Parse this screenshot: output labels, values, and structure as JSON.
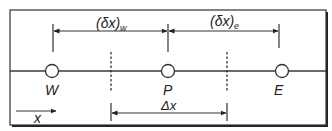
{
  "diagram": {
    "colors": {
      "line": "#3a3a3a",
      "frame": "#222222",
      "background": "#ffffff",
      "node_fill": "#ffffff"
    },
    "nodes": [
      {
        "id": "W",
        "label": "W",
        "x": 52
      },
      {
        "id": "P",
        "label": "P",
        "x": 168
      },
      {
        "id": "E",
        "label": "E",
        "x": 282
      }
    ],
    "faces": [
      {
        "id": "w",
        "x": 111
      },
      {
        "id": "e",
        "x": 227
      }
    ],
    "dimensions": {
      "dx_w": {
        "label_main": "(δx)",
        "label_sub": "w"
      },
      "dx_e": {
        "label_main": "(δx)",
        "label_sub": "e"
      },
      "Dx": {
        "label": "Δx"
      }
    },
    "axis": {
      "label": "x",
      "direction": "right"
    }
  }
}
